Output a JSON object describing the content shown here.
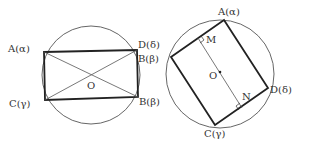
{
  "figure_left": {
    "labels": {
      "A": "A(α)",
      "D": "D(δ)",
      "B": "B(β)",
      "C": "C(γ)",
      "O": "O"
    }
  },
  "figure_right": {
    "labels": {
      "A": "A(α)",
      "B": "B(β)",
      "C": "C(γ)",
      "D": "D(δ)",
      "O": "O",
      "M": "M",
      "N": "N"
    }
  },
  "colors": {
    "stroke": "#222222",
    "thin": "#555555",
    "background": "#ffffff"
  }
}
